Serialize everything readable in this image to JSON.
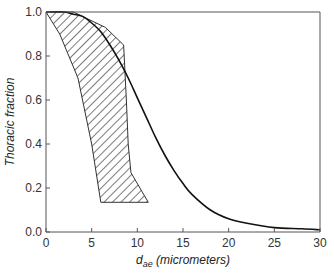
{
  "chart_data": {
    "type": "line",
    "title": "",
    "xlabel": "d_ae (micrometers)",
    "xlabel_main": "d",
    "xlabel_sub": "ae",
    "xlabel_rest": " (micrometers)",
    "ylabel": "Thoracic fraction",
    "xlim": [
      0,
      30
    ],
    "ylim": [
      0,
      1.0
    ],
    "x_ticks": [
      "0",
      "5",
      "10",
      "15",
      "20",
      "25",
      "30"
    ],
    "y_ticks": [
      "0.0",
      "0.2",
      "0.4",
      "0.6",
      "0.8",
      "1.0"
    ],
    "grid": false,
    "legend": null,
    "series": [
      {
        "name": "Thoracic convention curve",
        "style": "solid line",
        "x": [
          0,
          2,
          3,
          4,
          5,
          6,
          7,
          8,
          9,
          10,
          11,
          12,
          13,
          14,
          15,
          16,
          18,
          20,
          22,
          25,
          28,
          30
        ],
        "y": [
          1.0,
          1.0,
          0.99,
          0.98,
          0.95,
          0.91,
          0.85,
          0.78,
          0.7,
          0.61,
          0.52,
          0.43,
          0.35,
          0.28,
          0.22,
          0.17,
          0.1,
          0.06,
          0.04,
          0.02,
          0.015,
          0.01
        ]
      },
      {
        "name": "Hatched band (measured range)",
        "style": "hatched polygon",
        "polygon_x": [
          0,
          3,
          6.5,
          8.5,
          8.8,
          9.0,
          9.3,
          11.2,
          6.0,
          5.0,
          3.5,
          1.5,
          0
        ],
        "polygon_y": [
          1.0,
          1.0,
          0.93,
          0.85,
          0.6,
          0.4,
          0.27,
          0.135,
          0.135,
          0.4,
          0.7,
          0.9,
          1.0
        ]
      }
    ]
  }
}
